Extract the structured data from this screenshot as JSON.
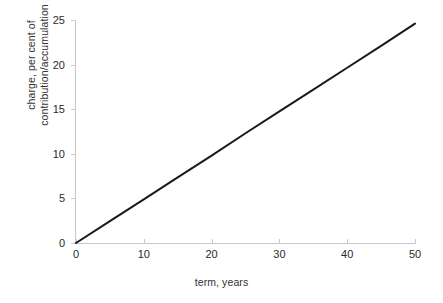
{
  "chart_data": {
    "type": "line",
    "title": "",
    "xlabel": "term, years",
    "ylabel": "charge, per cent of contribution/accumulation",
    "ylabel_line1": "charge, per cent of",
    "ylabel_line2": "contribution/accumulation",
    "xlim": [
      0,
      50
    ],
    "ylim": [
      0,
      25
    ],
    "xticks": [
      0,
      10,
      20,
      30,
      40,
      50
    ],
    "yticks": [
      0,
      5,
      10,
      15,
      20,
      25
    ],
    "xtick_labels": [
      "0",
      "10",
      "20",
      "30",
      "40",
      "50"
    ],
    "ytick_labels": [
      "0",
      "5",
      "10",
      "15",
      "20",
      "25"
    ],
    "grid": false,
    "legend": null,
    "series": [
      {
        "name": "charge",
        "color": "#1a1a1a",
        "line_width": 2,
        "x": [
          0,
          5,
          10,
          15,
          20,
          25,
          30,
          35,
          40,
          45,
          50
        ],
        "y": [
          0.0,
          2.45,
          4.9,
          7.35,
          9.8,
          12.3,
          14.75,
          17.2,
          19.65,
          22.1,
          24.6
        ]
      }
    ],
    "axis_color": "#c9c9c9",
    "text_color": "#2b2b2b",
    "background": "#ffffff"
  }
}
